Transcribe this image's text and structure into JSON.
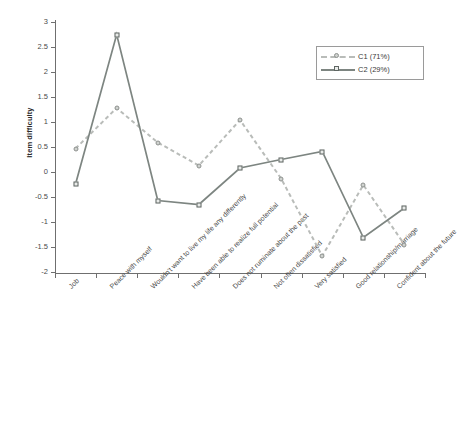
{
  "chart_data": {
    "type": "line",
    "title": "",
    "xlabel": "",
    "ylabel": "Item difficulty",
    "ylim": [
      -2,
      3
    ],
    "ytick_labels": [
      "3",
      "2.5",
      "2",
      "1.5",
      "1",
      "0.5",
      "0",
      "-0.5",
      "-1",
      "-1.5",
      "-2"
    ],
    "ytick_values": [
      3,
      2.5,
      2,
      1.5,
      1,
      0.5,
      0,
      -0.5,
      -1,
      -1.5,
      -2
    ],
    "grid": false,
    "legend_position": "top-right",
    "categories": [
      "Job",
      "Peace with myself",
      "Wouldn't want to live my life any differently",
      "Have been able to realize full potential",
      "Does not ruminate about the past",
      "Not often dissatisfied",
      "Very satisfied",
      "Good relationship/marriage",
      "Confident about the future"
    ],
    "series": [
      {
        "name": "C1 (71%)",
        "style": "dashed",
        "marker": "circle",
        "color": "#b9bcb9",
        "values": [
          0.47,
          1.28,
          0.59,
          0.13,
          1.04,
          -0.13,
          -1.68,
          -0.26,
          -1.45
        ]
      },
      {
        "name": "C2 (29%)",
        "style": "solid",
        "marker": "square",
        "color": "#7d8581",
        "values": [
          -0.24,
          2.75,
          -0.57,
          -0.65,
          0.08,
          0.25,
          0.41,
          -1.31,
          -0.72
        ]
      }
    ]
  }
}
